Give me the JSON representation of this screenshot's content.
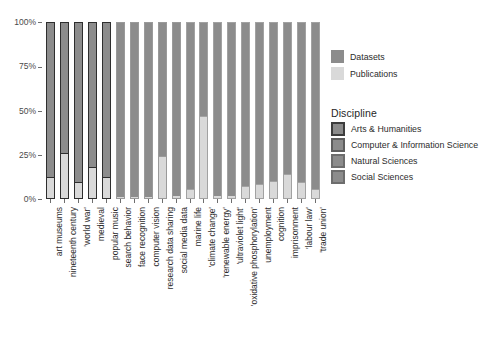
{
  "chart_data": {
    "type": "bar",
    "title": "",
    "subtitle": "",
    "xlabel": "",
    "ylabel": "",
    "stacked": true,
    "stack_mode": "percent",
    "ylim": [
      0,
      100
    ],
    "y_ticks": [
      "0%",
      "25%",
      "50%",
      "75%",
      "100%"
    ],
    "y_tick_values": [
      0,
      25,
      50,
      75,
      100
    ],
    "grid": false,
    "legend_position": "right",
    "categories": [
      "art museums",
      "nineteenth century",
      "'world war'",
      "medieval",
      "popular music",
      "search behavior",
      "face recognition",
      "computer vision",
      "research data sharing",
      "social media data",
      "marine life",
      "'climate change'",
      "'renewable energy'",
      "'ultraviolet light'",
      "'oxidative phosphorylation'",
      "unemployment",
      "cognition",
      "imprisonment",
      "'labour law'",
      "'trade union'"
    ],
    "category_disciplines": [
      "Arts & Humanities",
      "Arts & Humanities",
      "Arts & Humanities",
      "Arts & Humanities",
      "Arts & Humanities",
      "Computer & Information Science",
      "Computer & Information Science",
      "Computer & Information Science",
      "Computer & Information Science",
      "Computer & Information Science",
      "Natural Sciences",
      "Natural Sciences",
      "Natural Sciences",
      "Natural Sciences",
      "Natural Sciences",
      "Social Sciences",
      "Social Sciences",
      "Social Sciences",
      "Social Sciences",
      "Social Sciences"
    ],
    "series": [
      {
        "name": "Datasets",
        "values": [
          88,
          74,
          91,
          82,
          88,
          99.5,
          99.5,
          99.5,
          76,
          99,
          95,
          53,
          99,
          99,
          93,
          92,
          90,
          86,
          91,
          95
        ]
      },
      {
        "name": "Publications",
        "values": [
          12,
          26,
          9,
          18,
          12,
          0.5,
          0.5,
          0.5,
          24,
          1,
          5,
          47,
          1,
          1,
          7,
          8,
          10,
          14,
          9,
          5
        ]
      }
    ]
  },
  "fill_legend": {
    "items": [
      {
        "label": "Datasets",
        "color": "#8c8c8c"
      },
      {
        "label": "Publications",
        "color": "#d9d9d9"
      }
    ]
  },
  "discipline_legend": {
    "title": "Discipline",
    "items": [
      {
        "label": "Arts & Humanities",
        "color": "#3d3d3d"
      },
      {
        "label": "Computer & Information Science",
        "color": "#5e5e5e"
      },
      {
        "label": "Natural Sciences",
        "color": "#6d6d6d"
      },
      {
        "label": "Social Sciences",
        "color": "#6d6d6d"
      }
    ]
  },
  "colors": {
    "datasets": "#8c8c8c",
    "publications": "#d9d9d9",
    "outline_arts": "#2e2e2e",
    "outline_cis": "#9a9a9a",
    "outline_natural": "#a2a2a2",
    "outline_social": "#a2a2a2",
    "axis": "#6e6e6e",
    "text": "#2b2b2b",
    "background": "#ffffff"
  }
}
